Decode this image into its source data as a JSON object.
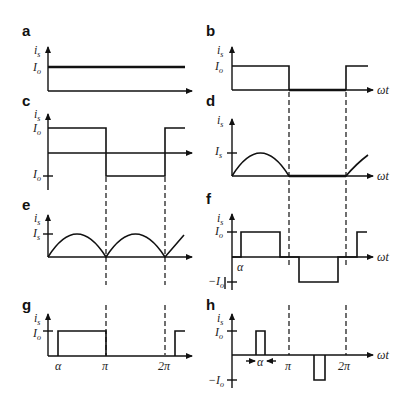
{
  "figure": {
    "panels": [
      {
        "id": "a",
        "label": "a",
        "y_axis": "i_s",
        "y_ticks": [
          "I_o"
        ],
        "x_axis": "",
        "waveform": "constant DC current I_o"
      },
      {
        "id": "b",
        "label": "b",
        "y_axis": "i_s",
        "y_ticks": [
          "I_o"
        ],
        "x_axis": "ωt",
        "waveform": "square pulse I_o from 0 to π, zero from π to 2π"
      },
      {
        "id": "c",
        "label": "c",
        "y_axis": "i_s",
        "y_ticks": [
          "I_o",
          "I_o"
        ],
        "x_axis": "",
        "waveform": "square wave +I_o from 0 to π, -I_o from π to 2π"
      },
      {
        "id": "d",
        "label": "d",
        "y_axis": "i_s",
        "y_ticks": [
          "I_s"
        ],
        "x_axis": "ωt",
        "waveform": "half-wave rectified sine, peak I_s"
      },
      {
        "id": "e",
        "label": "e",
        "y_axis": "i_s",
        "y_ticks": [
          "I_s"
        ],
        "x_axis": "",
        "waveform": "full-wave rectified sine, peak I_s"
      },
      {
        "id": "f",
        "label": "f",
        "y_axis": "i_s",
        "y_ticks": [
          "I_o",
          "−I_o"
        ],
        "x_axis": "ωt",
        "x_marks": [
          "α"
        ],
        "waveform": "quasi-square wave delayed by α"
      },
      {
        "id": "g",
        "label": "g",
        "y_axis": "i_s",
        "y_ticks": [
          "I_o"
        ],
        "x_axis": "",
        "x_marks": [
          "α",
          "π",
          "2π"
        ],
        "waveform": "pulse I_o from α to π"
      },
      {
        "id": "h",
        "label": "h",
        "y_axis": "i_s",
        "y_ticks": [
          "I_o",
          "−I_o"
        ],
        "x_axis": "ωt",
        "x_marks": [
          "α",
          "π",
          "2π"
        ],
        "waveform": "narrow pulses of width α, +I_o before π and −I_o after π"
      }
    ]
  },
  "labels": {
    "a": "a",
    "b": "b",
    "c": "c",
    "d": "d",
    "e": "e",
    "f": "f",
    "g": "g",
    "h": "h",
    "is": "i",
    "is_sub": "s",
    "Io": "I",
    "Io_sub": "o",
    "neg_Io": "−I",
    "Is": "I",
    "Is_sub": "s",
    "wt": "ωt",
    "alpha": "α",
    "pi": "π",
    "two_pi": "2π"
  }
}
